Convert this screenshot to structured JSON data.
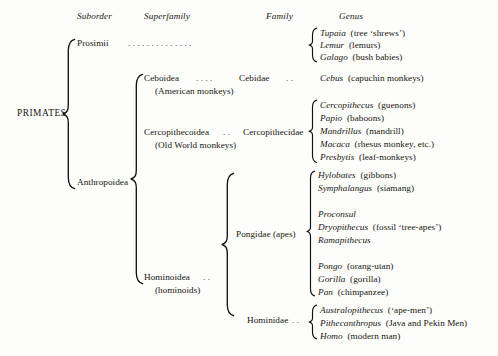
{
  "document": {
    "title": "Primate Classification",
    "root_label": "PRIMATES",
    "background_color": "#fdfdfc",
    "text_color": "#17150f"
  },
  "headers": [
    {
      "label": "Suborder"
    },
    {
      "label": "Superfamily"
    },
    {
      "label": "Family"
    },
    {
      "label": "Genus"
    }
  ],
  "suborders": [
    {
      "name": "Prosimii"
    },
    {
      "name": "Anthropoidea"
    }
  ],
  "superfamilies": [
    {
      "name": "Ceboidea",
      "common": "(American monkeys)"
    },
    {
      "name": "Cercopithecoidea",
      "common": "(Old World monkeys)"
    },
    {
      "name": "Hominoidea",
      "common": "(hominoids)"
    }
  ],
  "families": [
    {
      "name": "Cebidae"
    },
    {
      "name": "Cercopithecidae"
    },
    {
      "name": "Pongidae (apes)"
    },
    {
      "name": "Hominidae"
    }
  ],
  "genera": {
    "prosimii": [
      {
        "genus": "Tupaia",
        "common": "(tree ‘shrews’)"
      },
      {
        "genus": "Lemur",
        "common": "(lemurs)"
      },
      {
        "genus": "Galago",
        "common": "(bush babies)"
      }
    ],
    "cebidae": [
      {
        "genus": "Cebus",
        "common": "(capuchin monkeys)"
      }
    ],
    "cercopithecidae": [
      {
        "genus": "Cercopithecus",
        "common": "(guenons)"
      },
      {
        "genus": "Papio",
        "common": "(baboons)"
      },
      {
        "genus": "Mandrillus",
        "common": "(mandrill)"
      },
      {
        "genus": "Macaca",
        "common": "(rhesus monkey, etc.)"
      },
      {
        "genus": "Presbytis",
        "common": "(leaf-monkeys)"
      }
    ],
    "pongidae_group1": [
      {
        "genus": "Hylobates",
        "common": "(gibbons)"
      },
      {
        "genus": "Symphalangus",
        "common": "(siamang)"
      }
    ],
    "pongidae_group2": [
      {
        "genus": "Proconsul",
        "common": ""
      },
      {
        "genus": "Dryopithecus",
        "common": "(fossil ‘tree-apes’)"
      },
      {
        "genus": "Ramapithecus",
        "common": ""
      }
    ],
    "pongidae_group3": [
      {
        "genus": "Pongo",
        "common": "(orang-utan)"
      },
      {
        "genus": "Gorilla",
        "common": "(gorilla)"
      },
      {
        "genus": "Pan",
        "common": "(chimpanzee)"
      }
    ],
    "hominidae": [
      {
        "genus": "Australopithecus",
        "common": "(‘ape-men’)"
      },
      {
        "genus": "Pithecanthropus",
        "common": "(Java and Pekin Men)"
      },
      {
        "genus": "Homo",
        "common": "(modern man)"
      }
    ]
  },
  "leaders": {
    "prosimii_to_genus": ".   .   .   .   .   .   .   .   .   .   .   .   .   .",
    "ceboidea_to_cebidae": ".     .     .     .",
    "cebidae_to_genus": ".     .",
    "cercopithecoidea_to_family": ".      .",
    "hominoidea_to_family": ".      .",
    "hominidae_to_genus": ".     ."
  }
}
